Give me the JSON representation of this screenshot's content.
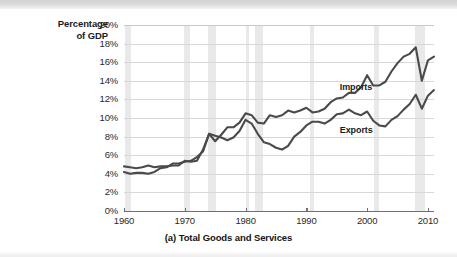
{
  "figure": {
    "caption": "(a) Total Goods and Services",
    "y_axis_title_line1": "Percentage",
    "y_axis_title_line2": "of GDP"
  },
  "chart_data": {
    "type": "line",
    "title": "(a) Total Goods and Services",
    "xlabel": "",
    "ylabel": "Percentage of GDP",
    "xlim": [
      1960,
      2011
    ],
    "ylim": [
      0,
      20
    ],
    "grid": true,
    "legend_position": "inline-annotation",
    "x_ticks": [
      1960,
      1970,
      1980,
      1990,
      2000,
      2010
    ],
    "x_tick_labels": [
      "1960",
      "1970",
      "1980",
      "1990",
      "2000",
      "2010"
    ],
    "y_ticks": [
      0,
      2,
      4,
      6,
      8,
      10,
      12,
      14,
      16,
      18,
      20
    ],
    "y_tick_labels": [
      "0%",
      "2%",
      "4%",
      "6%",
      "8%",
      "10%",
      "12%",
      "14%",
      "16%",
      "18%",
      "20%"
    ],
    "annotations": [
      {
        "text": "Imports",
        "x": 1995.5,
        "y": 13.2
      },
      {
        "text": "Exports",
        "x": 1995.5,
        "y": 8.6
      }
    ],
    "recession_bands": [
      [
        1960.2,
        1961.1
      ],
      [
        1969.9,
        1970.9
      ],
      [
        1973.9,
        1975.2
      ],
      [
        1980.0,
        1980.6
      ],
      [
        1981.6,
        1982.9
      ],
      [
        1990.6,
        1991.2
      ],
      [
        2001.2,
        2001.9
      ],
      [
        2007.9,
        2009.5
      ]
    ],
    "x": [
      1960,
      1961,
      1962,
      1963,
      1964,
      1965,
      1966,
      1967,
      1968,
      1969,
      1970,
      1971,
      1972,
      1973,
      1974,
      1975,
      1976,
      1977,
      1978,
      1979,
      1980,
      1981,
      1982,
      1983,
      1984,
      1985,
      1986,
      1987,
      1988,
      1989,
      1990,
      1991,
      1992,
      1993,
      1994,
      1995,
      1996,
      1997,
      1998,
      1999,
      2000,
      2001,
      2002,
      2003,
      2004,
      2005,
      2006,
      2007,
      2008,
      2009,
      2010,
      2011
    ],
    "series": [
      {
        "name": "Imports",
        "color": "#4a4a4c",
        "values": [
          4.2,
          4.0,
          4.1,
          4.1,
          4.0,
          4.2,
          4.6,
          4.7,
          5.1,
          5.1,
          5.3,
          5.4,
          5.8,
          6.4,
          8.3,
          7.5,
          8.2,
          9.0,
          9.0,
          9.5,
          10.5,
          10.3,
          9.5,
          9.4,
          10.3,
          10.1,
          10.3,
          10.8,
          10.6,
          10.8,
          11.1,
          10.6,
          10.7,
          11.0,
          11.7,
          12.1,
          12.2,
          12.7,
          12.7,
          13.3,
          14.6,
          13.5,
          13.5,
          13.9,
          15.0,
          15.9,
          16.6,
          16.9,
          17.6,
          14.0,
          16.2,
          16.6
        ]
      },
      {
        "name": "Exports",
        "color": "#4a4a4c",
        "values": [
          4.8,
          4.7,
          4.6,
          4.7,
          4.9,
          4.7,
          4.8,
          4.8,
          4.9,
          4.9,
          5.4,
          5.3,
          5.4,
          6.6,
          8.3,
          8.1,
          7.9,
          7.6,
          7.9,
          8.6,
          9.8,
          9.4,
          8.3,
          7.4,
          7.2,
          6.8,
          6.6,
          7.0,
          8.0,
          8.5,
          9.2,
          9.6,
          9.6,
          9.4,
          9.8,
          10.4,
          10.5,
          10.9,
          10.5,
          10.3,
          10.7,
          9.7,
          9.2,
          9.1,
          9.8,
          10.2,
          10.9,
          11.5,
          12.5,
          11.0,
          12.4,
          13.0
        ]
      }
    ]
  }
}
